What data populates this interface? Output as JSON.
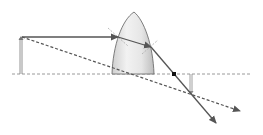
{
  "diagram": {
    "type": "ray-diagram-plano-convex-lens",
    "colors": {
      "background": "#ffffff",
      "ray": "#555555",
      "axis": "#999999",
      "lens_fill_light": "#f4f4f4",
      "lens_fill_dark": "#c8c8c8",
      "lens_stroke": "#777777",
      "focal_point": "#111111",
      "normal_line": "#aaaaaa"
    },
    "optical_axis": {
      "x1": 12,
      "y": 74,
      "x2": 251
    },
    "object": {
      "x": 21,
      "base_y": 74,
      "tip_y": 37
    },
    "image": {
      "x": 191,
      "base_y": 74,
      "tip_y": 94
    },
    "lens": {
      "tip": [
        134,
        12
      ],
      "base_left": [
        112,
        74
      ],
      "base_right": [
        154,
        74
      ]
    },
    "focal_point": {
      "x": 174,
      "y": 74
    },
    "rays": [
      {
        "name": "parallel-ray-incident",
        "style": "solid",
        "points": [
          [
            22,
            37
          ],
          [
            118,
            37
          ]
        ]
      },
      {
        "name": "parallel-ray-in-lens",
        "style": "solid",
        "points": [
          [
            118,
            37
          ],
          [
            151,
            47
          ]
        ]
      },
      {
        "name": "parallel-ray-refracted",
        "style": "solid",
        "points": [
          [
            151,
            47
          ],
          [
            216,
            123
          ]
        ]
      },
      {
        "name": "chief-ray",
        "style": "dashed",
        "points": [
          [
            22,
            37
          ],
          [
            240,
            111
          ]
        ]
      }
    ]
  }
}
